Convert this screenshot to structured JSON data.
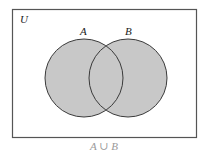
{
  "diagram": {
    "type": "venn",
    "universe_label": "U",
    "sets": [
      {
        "label": "A",
        "cx": 84,
        "cy": 78,
        "r": 39
      },
      {
        "label": "B",
        "cx": 128,
        "cy": 78,
        "r": 39
      }
    ],
    "shaded_region": "A ∪ B",
    "caption": "A ∪ B",
    "colors": {
      "fill": "#c8c8c8",
      "stroke": "#3a3a3a",
      "frame": "#555555",
      "caption": "#9a9a9a"
    },
    "frame": {
      "x": 12,
      "y": 9,
      "width": 184,
      "height": 128
    }
  }
}
